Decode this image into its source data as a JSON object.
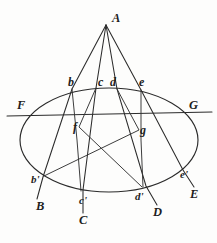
{
  "figure": {
    "type": "geometric-diagram",
    "width": 217,
    "height": 243,
    "ink_color": "#2b2b2b",
    "background_color": "#fdfdfc"
  },
  "labels": {
    "apex": {
      "text": "A",
      "x": 112,
      "y": 12
    },
    "upper_points": [
      {
        "text": "b",
        "x": 68,
        "y": 76
      },
      {
        "text": "c",
        "x": 98,
        "y": 76
      },
      {
        "text": "d",
        "x": 110,
        "y": 76
      },
      {
        "text": "e",
        "x": 139,
        "y": 76
      }
    ],
    "inner_points": [
      {
        "text": "f",
        "x": 73,
        "y": 121
      },
      {
        "text": "g",
        "x": 140,
        "y": 124
      }
    ],
    "axis_points": [
      {
        "text": "F",
        "x": 17,
        "y": 99
      },
      {
        "text": "G",
        "x": 189,
        "y": 99
      }
    ],
    "prime_points": [
      {
        "text": "b'",
        "x": 31,
        "y": 174
      },
      {
        "text": "c'",
        "x": 79,
        "y": 195
      },
      {
        "text": "d'",
        "x": 135,
        "y": 191
      },
      {
        "text": "e'",
        "x": 180,
        "y": 169
      }
    ],
    "terminal_points": [
      {
        "text": "B",
        "x": 36,
        "y": 200
      },
      {
        "text": "C",
        "x": 79,
        "y": 214
      },
      {
        "text": "D",
        "x": 153,
        "y": 206
      },
      {
        "text": "E",
        "x": 190,
        "y": 188
      }
    ]
  },
  "geometry": {
    "ellipse": {
      "cx": 109,
      "cy": 140,
      "rx": 89,
      "ry": 52
    },
    "apex_vertex": {
      "x": 106,
      "y": 25
    },
    "horizontal_axis": {
      "x1": 7,
      "y1": 116,
      "x2": 212,
      "y2": 112
    },
    "rays": [
      {
        "name": "ray-A-b-bprime-B",
        "points": "106,25 72,89 43,177 37,199"
      },
      {
        "name": "ray-A-c-cprime-C",
        "points": "106,25 96,88 83,190 83,213"
      },
      {
        "name": "ray-A-d-dprime-D",
        "points": "106,25 117,89 146,186 157,205"
      },
      {
        "name": "ray-A-e-eprime-E",
        "points": "106,25 141,90 183,170 194,187"
      }
    ],
    "chords": [
      {
        "name": "chord-b-cprime",
        "points": "72,89 78,145 81,191"
      },
      {
        "name": "chord-e-dprime",
        "points": "141,90 141,140 143,187"
      },
      {
        "name": "chord-c-f-dprime",
        "points": "96,88 79,128 142,187"
      },
      {
        "name": "chord-d-g-bprime",
        "points": "117,89 140,131 44,176"
      }
    ]
  }
}
